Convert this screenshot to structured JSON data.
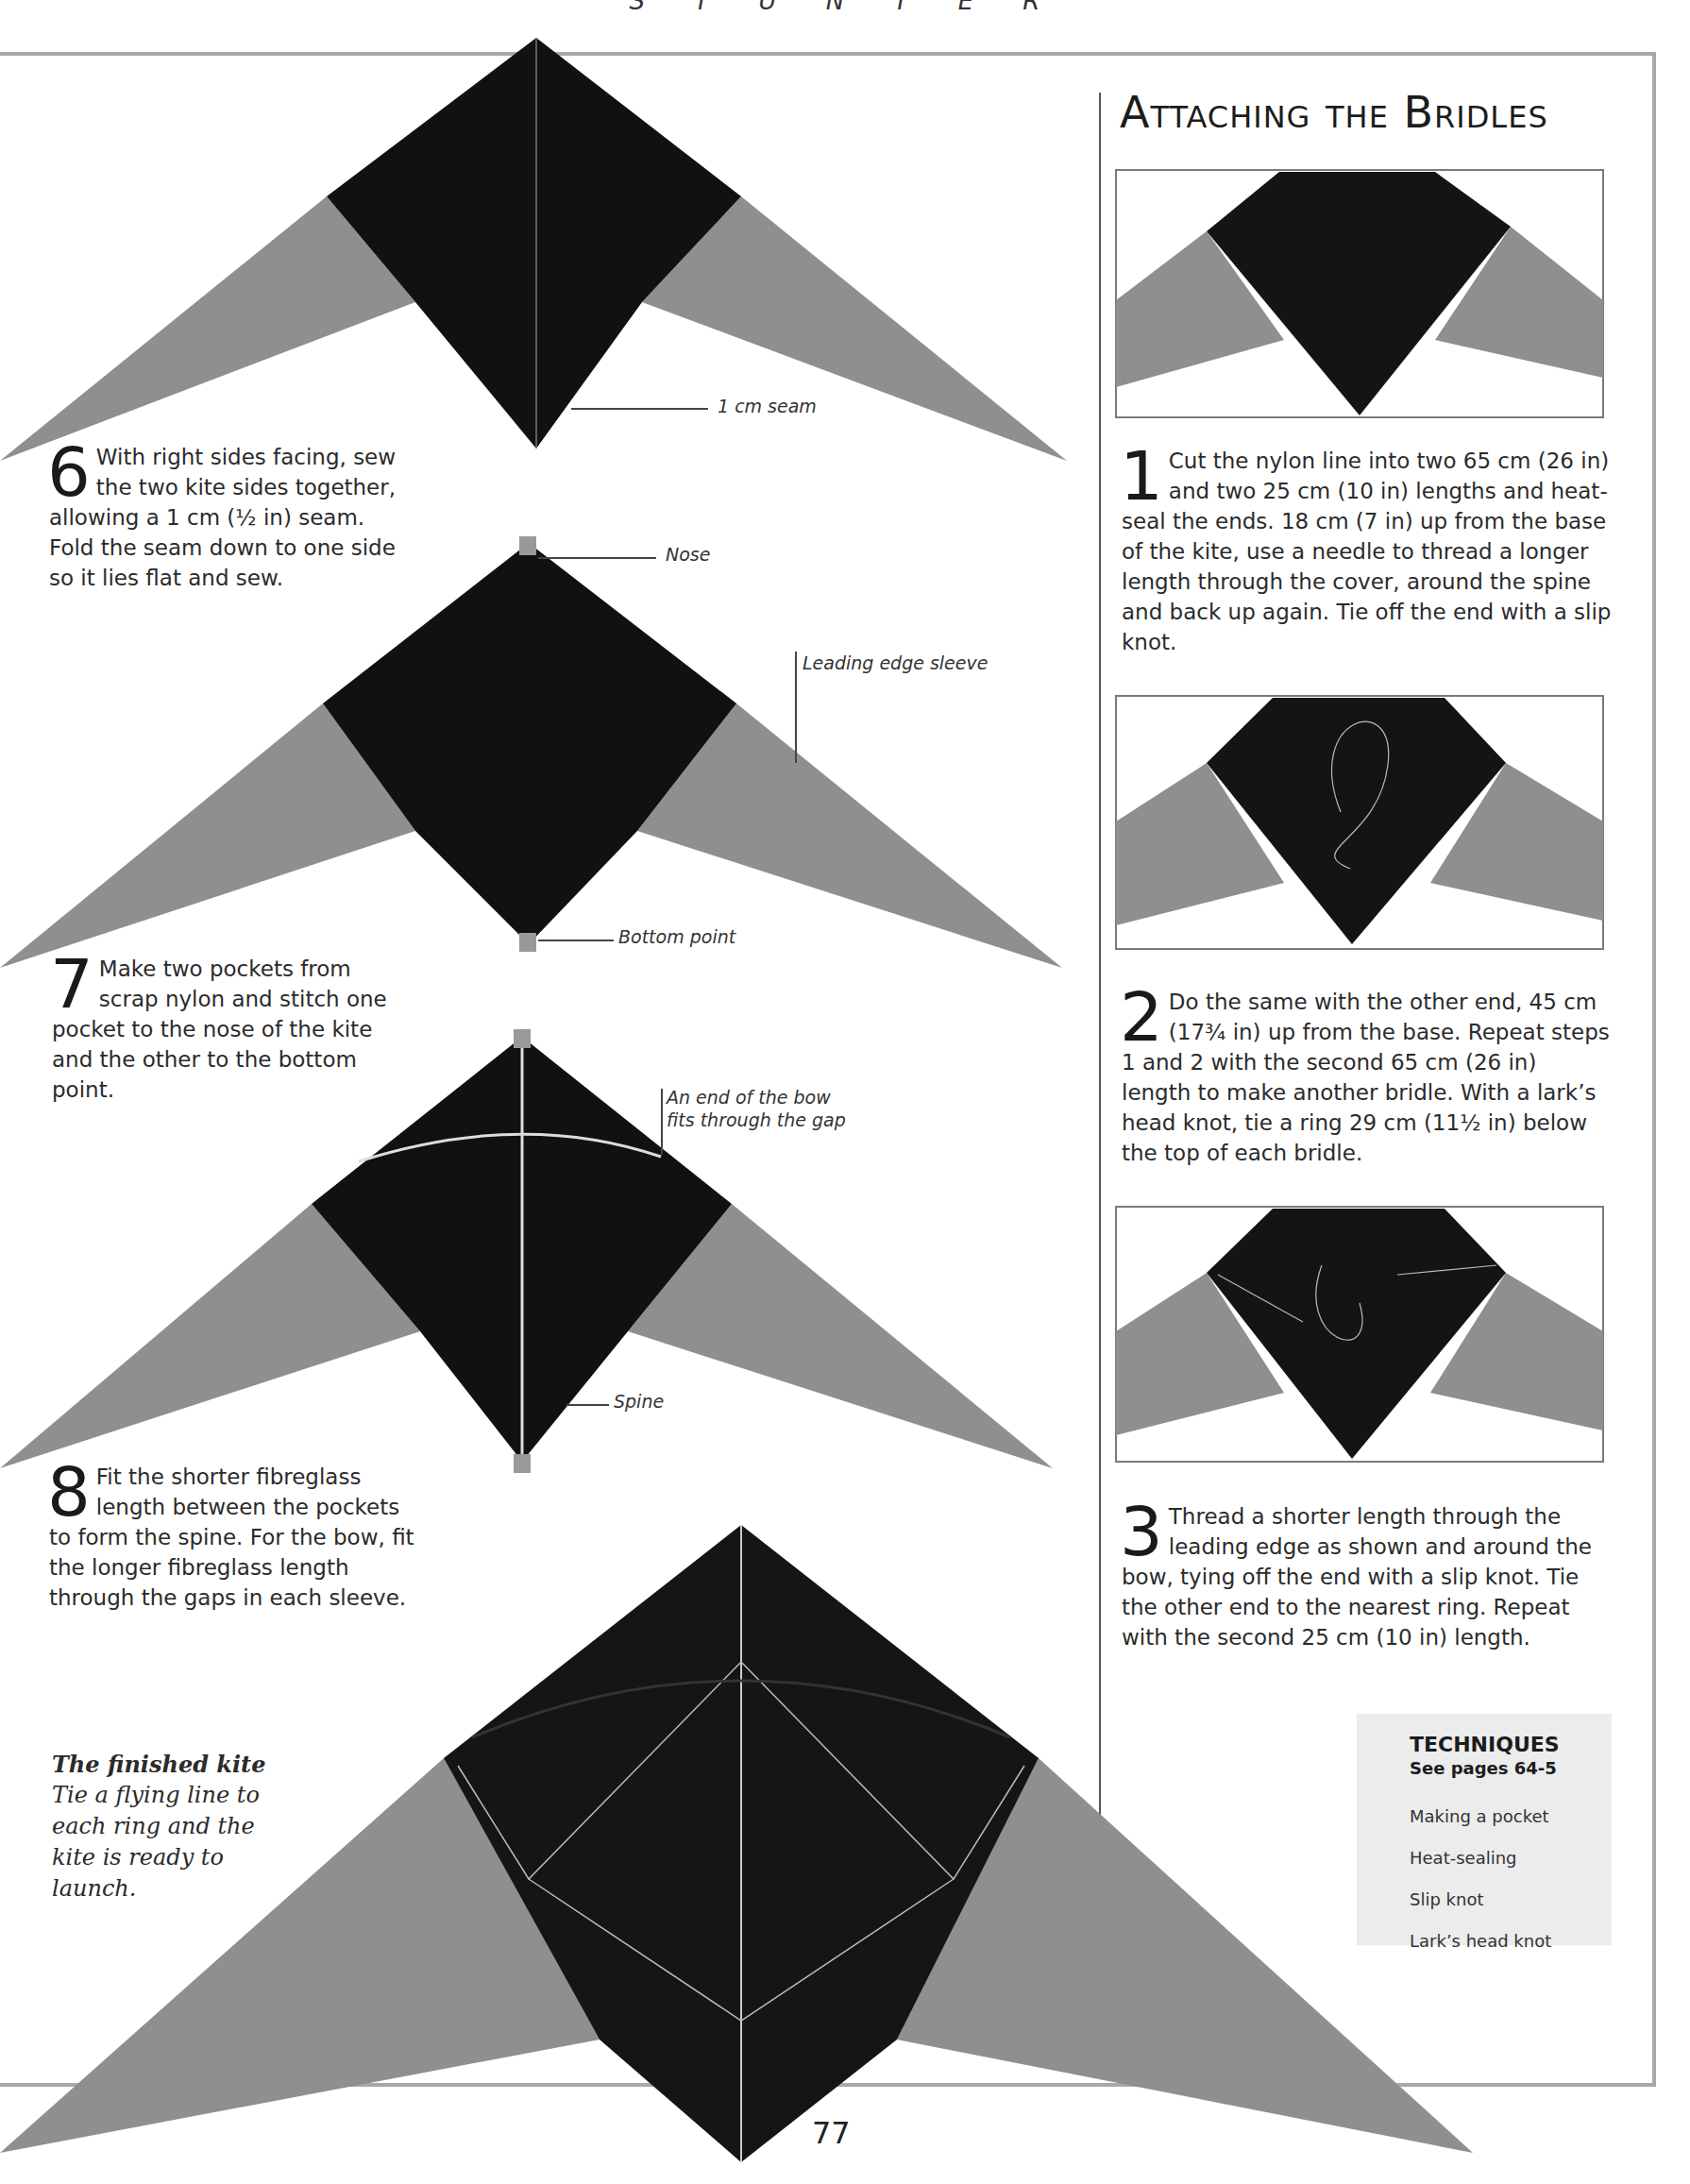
{
  "header": {
    "running_head": "S T U N T E R"
  },
  "page_number": "77",
  "colors": {
    "sail_black": "#111111",
    "wing_grey": "#8f8f8f",
    "rule": "#a8a8a8",
    "techniques_bg": "#ececec"
  },
  "left_column": {
    "steps": [
      {
        "number": "6",
        "first_lines": "With right sides facing, sew the two kite sides together,",
        "rest": "allowing a 1 cm (½ in) seam. Fold the seam down to one side so it lies flat and sew."
      },
      {
        "number": "7",
        "first_lines": "Make two pockets from scrap nylon and stitch one pocket",
        "rest": "to the nose of the kite and the other to the bottom point."
      },
      {
        "number": "8",
        "first_lines": "Fit the shorter fibreglass length between the pockets",
        "rest": "to form the spine. For the bow, fit the longer fibreglass length through the gaps in each sleeve."
      }
    ],
    "callouts": {
      "seam": "1 cm seam",
      "nose": "Nose",
      "leading_edge": "Leading edge sleeve",
      "bottom_point": "Bottom point",
      "bow_end_line1": "An end of the bow",
      "bow_end_line2": "fits through the gap",
      "spine": "Spine"
    },
    "finished_kite": {
      "heading": "The finished kite",
      "text": "Tie a flying line to each ring and the kite is ready to launch."
    }
  },
  "right_column": {
    "title": "Attaching the Bridles",
    "steps": [
      {
        "number": "1",
        "text": "Cut the nylon line into two 65 cm (26 in) and two 25 cm (10 in) lengths and heat-seal the ends. 18 cm (7 in) up from the base of the kite, use a needle to thread a longer length through the cover, around the spine and back up again. Tie off the end with a slip knot."
      },
      {
        "number": "2",
        "text": "Do the same with the other end, 45 cm (17¾ in) up from the base. Repeat steps 1 and 2 with the second 65 cm (26 in) length to make another bridle. With a lark’s head knot, tie a ring 29 cm (11½ in) below the top of each bridle."
      },
      {
        "number": "3",
        "text": "Thread a shorter length through the leading edge as shown and around the bow, tying off the end with a slip knot. Tie the other end to the nearest ring. Repeat with the second 25 cm (10 in) length."
      }
    ],
    "techniques": {
      "title": "TECHNIQUES",
      "subtitle": "See pages 64-5",
      "items": [
        "Making a pocket",
        "Heat-sealing",
        "Slip knot",
        "Lark’s head knot"
      ]
    }
  }
}
